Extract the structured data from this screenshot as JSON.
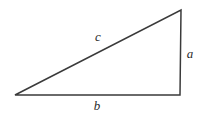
{
  "figure": {
    "name": "right-triangle",
    "type": "geometry-diagram",
    "background_color": "#ffffff",
    "stroke_color": "#3a3a3a",
    "label_color": "#2b2b2b",
    "stroke_width": 1.5
  },
  "labels": {
    "hypotenuse": "c",
    "vertical_leg": "a",
    "horizontal_leg": "b"
  },
  "chart_data": {
    "type": "diagram",
    "title": "",
    "shape": "right triangle",
    "vertices": [
      {
        "name": "left-vertex",
        "x": 15,
        "y": 95
      },
      {
        "name": "bottom-right-vertex",
        "x": 180,
        "y": 95
      },
      {
        "name": "top-vertex",
        "x": 181,
        "y": 10
      }
    ],
    "edges": [
      {
        "name": "horizontal-leg",
        "label": "b",
        "from": "left-vertex",
        "to": "bottom-right-vertex"
      },
      {
        "name": "vertical-leg",
        "label": "a",
        "from": "bottom-right-vertex",
        "to": "top-vertex"
      },
      {
        "name": "hypotenuse",
        "label": "c",
        "from": "top-vertex",
        "to": "left-vertex"
      }
    ],
    "label_positions": [
      {
        "text": "c",
        "x": 98,
        "y": 36
      },
      {
        "text": "a",
        "x": 190,
        "y": 53
      },
      {
        "text": "b",
        "x": 97,
        "y": 105
      }
    ]
  }
}
